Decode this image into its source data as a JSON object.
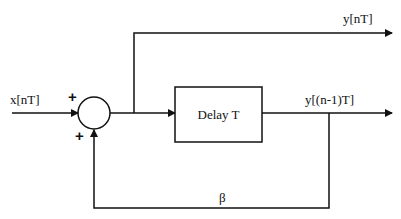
{
  "diagram": {
    "type": "block-diagram",
    "title": "",
    "nodes": {
      "input": {
        "label": "x[nT]"
      },
      "summer": {
        "signs": [
          "+",
          "+"
        ]
      },
      "delay_block": {
        "label": "Delay T"
      },
      "output_top": {
        "label": "y[nT]"
      },
      "output_delayed": {
        "label": "y[(n-1)T]"
      },
      "feedback_gain": {
        "label": "β"
      }
    },
    "edges": [
      {
        "from": "input",
        "to": "summer",
        "sign": "+"
      },
      {
        "from": "summer",
        "to": "delay_block"
      },
      {
        "from": "summer",
        "to": "output_top"
      },
      {
        "from": "delay_block",
        "to": "output_delayed"
      },
      {
        "from": "output_delayed",
        "to": "summer",
        "via": "feedback_gain",
        "sign": "+"
      }
    ],
    "colors": {
      "stroke": "#111111",
      "background": "#ffffff"
    }
  }
}
